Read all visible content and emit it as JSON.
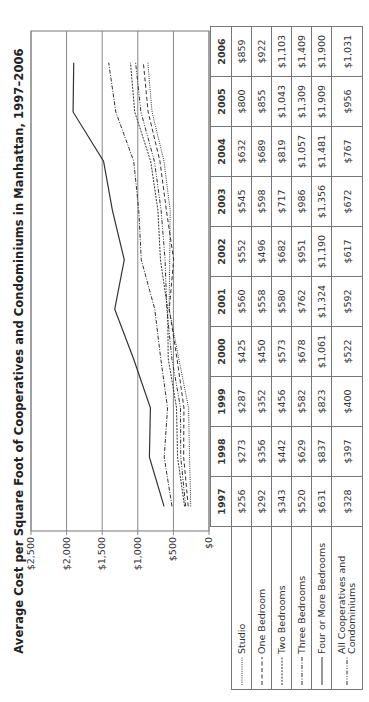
{
  "chart_data": {
    "type": "line",
    "title": "Average Cost per Square Foot of Cooperatives and Condominiums in Manhattan, 1997–2006",
    "xlabel": "",
    "ylabel": "",
    "ylim": [
      0,
      2500
    ],
    "y_ticks": [
      "$0",
      "$500",
      "$1,000",
      "$1,500",
      "$2,000",
      "$2,500"
    ],
    "grid": true,
    "legend_position": "table-left",
    "categories": [
      "1997",
      "1998",
      "1999",
      "2000",
      "2001",
      "2002",
      "2003",
      "2004",
      "2005",
      "2006"
    ],
    "series": [
      {
        "name": "Studio",
        "style": "dotted",
        "values": [
          256,
          273,
          287,
          425,
          560,
          552,
          545,
          632,
          800,
          859
        ],
        "labels": [
          "$256",
          "$273",
          "$287",
          "$425",
          "$560",
          "$552",
          "$545",
          "$632",
          "$800",
          "$859"
        ]
      },
      {
        "name": "One Bedroom",
        "style": "dashed",
        "values": [
          292,
          356,
          352,
          450,
          558,
          496,
          598,
          689,
          855,
          922
        ],
        "labels": [
          "$292",
          "$356",
          "$352",
          "$450",
          "$558",
          "$496",
          "$598",
          "$689",
          "$855",
          "$922"
        ]
      },
      {
        "name": "Two Bedrooms",
        "style": "short-dashed",
        "values": [
          343,
          442,
          456,
          573,
          580,
          682,
          717,
          819,
          1043,
          1103
        ],
        "labels": [
          "$343",
          "$442",
          "$456",
          "$573",
          "$580",
          "$682",
          "$717",
          "$819",
          "$1,043",
          "$1,103"
        ]
      },
      {
        "name": "Three Bedrooms",
        "style": "dash-dot",
        "values": [
          520,
          629,
          582,
          678,
          762,
          951,
          986,
          1057,
          1309,
          1409
        ],
        "labels": [
          "$520",
          "$629",
          "$582",
          "$678",
          "$762",
          "$951",
          "$986",
          "$1,057",
          "$1,309",
          "$1,409"
        ]
      },
      {
        "name": "Four or More Bedrooms",
        "style": "solid",
        "values": [
          631,
          837,
          823,
          1061,
          1324,
          1190,
          1356,
          1481,
          1909,
          1900
        ],
        "labels": [
          "$631",
          "$837",
          "$823",
          "$1,061",
          "$1,324",
          "$1,190",
          "$1,356",
          "$1,481",
          "$1,909",
          "$1,900"
        ]
      },
      {
        "name": "All Cooperatives and Condominiums",
        "style": "dash-dot-dot",
        "values": [
          328,
          397,
          400,
          522,
          592,
          617,
          672,
          767,
          956,
          1031
        ],
        "labels": [
          "$328",
          "$397",
          "$400",
          "$522",
          "$592",
          "$617",
          "$672",
          "$767",
          "$956",
          "$1,031"
        ]
      }
    ]
  }
}
